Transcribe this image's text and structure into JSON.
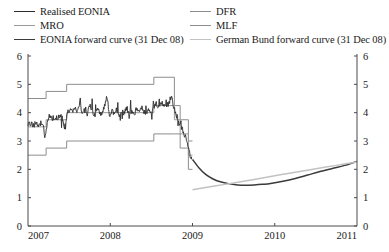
{
  "legend": {
    "left_column": [
      {
        "label": "Realised EONIA",
        "color": "#2b2b2b",
        "key": "realised-eonia"
      },
      {
        "label": "MRO",
        "color": "#9a9a9a",
        "key": "mro"
      },
      {
        "label": "EONIA forward curve (31 Dec 08)",
        "color": "#3a3a3a",
        "key": "eonia-forward-curve"
      }
    ],
    "right_column": [
      {
        "label": "DFR",
        "color": "#8d8d8d",
        "key": "dfr"
      },
      {
        "label": "MLF",
        "color": "#8d8d8d",
        "key": "mlf"
      },
      {
        "label": "German Bund forward curve (31 Dec 08)",
        "color": "#c2c2c2",
        "key": "german-bund-forward-curve"
      }
    ]
  },
  "axes": {
    "y_left_ticks": [
      "0",
      "1",
      "2",
      "3",
      "4",
      "5",
      "6"
    ],
    "y_right_ticks": [
      "0",
      "1",
      "2",
      "3",
      "4",
      "5",
      "6"
    ],
    "x_ticks": [
      "2007",
      "2008",
      "2009",
      "2010",
      "2011"
    ]
  },
  "chart_data": {
    "type": "line",
    "title": "",
    "subtitle": "",
    "xlabel": "",
    "ylabel": "",
    "xlim": [
      2007.0,
      2011.0
    ],
    "ylim": [
      0,
      6
    ],
    "grid": false,
    "legend_position": "top",
    "x_tick_values": [
      2007,
      2008,
      2009,
      2010,
      2011
    ],
    "y_tick_values": [
      0,
      1,
      2,
      3,
      4,
      5,
      6
    ],
    "series": [
      {
        "name": "MLF",
        "color": "#8d8d8d",
        "style": "step",
        "points": [
          [
            2007.0,
            4.5
          ],
          [
            2007.22,
            4.5
          ],
          [
            2007.22,
            4.75
          ],
          [
            2007.47,
            4.75
          ],
          [
            2007.47,
            5.0
          ],
          [
            2008.53,
            5.0
          ],
          [
            2008.53,
            5.25
          ],
          [
            2008.78,
            5.25
          ],
          [
            2008.78,
            4.25
          ],
          [
            2008.85,
            4.25
          ],
          [
            2008.85,
            3.75
          ],
          [
            2008.95,
            3.75
          ],
          [
            2008.95,
            3.0
          ],
          [
            2009.0,
            3.0
          ]
        ]
      },
      {
        "name": "MRO",
        "color": "#9a9a9a",
        "style": "step",
        "points": [
          [
            2007.0,
            3.5
          ],
          [
            2007.22,
            3.5
          ],
          [
            2007.22,
            3.75
          ],
          [
            2007.47,
            3.75
          ],
          [
            2007.47,
            4.0
          ],
          [
            2008.53,
            4.0
          ],
          [
            2008.53,
            4.25
          ],
          [
            2008.78,
            4.25
          ],
          [
            2008.78,
            3.75
          ],
          [
            2008.85,
            3.75
          ],
          [
            2008.85,
            3.25
          ],
          [
            2008.95,
            3.25
          ],
          [
            2008.95,
            2.5
          ],
          [
            2009.0,
            2.5
          ]
        ]
      },
      {
        "name": "DFR",
        "color": "#8d8d8d",
        "style": "step",
        "points": [
          [
            2007.0,
            2.5
          ],
          [
            2007.22,
            2.5
          ],
          [
            2007.22,
            2.75
          ],
          [
            2007.47,
            2.75
          ],
          [
            2007.47,
            3.0
          ],
          [
            2008.53,
            3.0
          ],
          [
            2008.53,
            3.25
          ],
          [
            2008.78,
            3.25
          ],
          [
            2008.78,
            3.25
          ],
          [
            2008.85,
            3.25
          ],
          [
            2008.85,
            2.75
          ],
          [
            2008.95,
            2.75
          ],
          [
            2008.95,
            2.0
          ],
          [
            2009.0,
            2.0
          ]
        ]
      },
      {
        "name": "Realised EONIA",
        "color": "#2b2b2b",
        "style": "noisy-line",
        "points": [
          [
            2007.0,
            3.57
          ],
          [
            2007.03,
            3.62
          ],
          [
            2007.06,
            3.55
          ],
          [
            2007.09,
            3.6
          ],
          [
            2007.12,
            3.58
          ],
          [
            2007.15,
            3.63
          ],
          [
            2007.18,
            3.56
          ],
          [
            2007.21,
            3.1
          ],
          [
            2007.24,
            3.82
          ],
          [
            2007.27,
            3.88
          ],
          [
            2007.3,
            3.8
          ],
          [
            2007.33,
            3.86
          ],
          [
            2007.36,
            3.83
          ],
          [
            2007.39,
            3.9
          ],
          [
            2007.42,
            3.78
          ],
          [
            2007.45,
            3.3
          ],
          [
            2007.48,
            4.05
          ],
          [
            2007.51,
            4.12
          ],
          [
            2007.54,
            4.02
          ],
          [
            2007.57,
            4.2
          ],
          [
            2007.6,
            4.05
          ],
          [
            2007.63,
            4.35
          ],
          [
            2007.66,
            4.0
          ],
          [
            2007.69,
            4.08
          ],
          [
            2007.72,
            3.95
          ],
          [
            2007.75,
            4.3
          ],
          [
            2007.78,
            4.05
          ],
          [
            2007.81,
            3.9
          ],
          [
            2007.84,
            4.15
          ],
          [
            2007.87,
            4.02
          ],
          [
            2007.9,
            3.92
          ],
          [
            2007.93,
            4.25
          ],
          [
            2007.96,
            4.6
          ],
          [
            2007.99,
            3.9
          ],
          [
            2008.02,
            4.05
          ],
          [
            2008.05,
            3.98
          ],
          [
            2008.08,
            4.1
          ],
          [
            2008.11,
            3.95
          ],
          [
            2008.14,
            4.06
          ],
          [
            2008.17,
            4.0
          ],
          [
            2008.2,
            4.18
          ],
          [
            2008.23,
            3.97
          ],
          [
            2008.26,
            4.08
          ],
          [
            2008.29,
            3.96
          ],
          [
            2008.32,
            4.12
          ],
          [
            2008.35,
            4.0
          ],
          [
            2008.38,
            4.22
          ],
          [
            2008.41,
            3.98
          ],
          [
            2008.44,
            4.05
          ],
          [
            2008.47,
            4.1
          ],
          [
            2008.5,
            3.99
          ],
          [
            2008.53,
            4.2
          ],
          [
            2008.56,
            4.3
          ],
          [
            2008.59,
            4.22
          ],
          [
            2008.62,
            4.35
          ],
          [
            2008.65,
            4.25
          ],
          [
            2008.68,
            4.4
          ],
          [
            2008.71,
            4.28
          ],
          [
            2008.74,
            4.6
          ],
          [
            2008.77,
            4.2
          ],
          [
            2008.8,
            3.95
          ],
          [
            2008.83,
            3.7
          ],
          [
            2008.86,
            3.55
          ],
          [
            2008.89,
            3.3
          ],
          [
            2008.92,
            3.1
          ],
          [
            2008.95,
            2.7
          ],
          [
            2008.97,
            2.5
          ],
          [
            2008.99,
            2.35
          ]
        ]
      },
      {
        "name": "EONIA forward curve (31 Dec 08)",
        "color": "#3a3a3a",
        "style": "smooth",
        "points": [
          [
            2009.0,
            2.35
          ],
          [
            2009.08,
            2.05
          ],
          [
            2009.16,
            1.82
          ],
          [
            2009.25,
            1.66
          ],
          [
            2009.35,
            1.55
          ],
          [
            2009.45,
            1.49
          ],
          [
            2009.55,
            1.45
          ],
          [
            2009.65,
            1.44
          ],
          [
            2009.75,
            1.45
          ],
          [
            2009.85,
            1.47
          ],
          [
            2009.95,
            1.5
          ],
          [
            2010.1,
            1.58
          ],
          [
            2010.25,
            1.68
          ],
          [
            2010.4,
            1.8
          ],
          [
            2010.55,
            1.92
          ],
          [
            2010.7,
            2.03
          ],
          [
            2010.85,
            2.14
          ],
          [
            2011.0,
            2.28
          ]
        ]
      },
      {
        "name": "German Bund forward curve (31 Dec 08)",
        "color": "#c2c2c2",
        "style": "smooth",
        "points": [
          [
            2009.0,
            1.28
          ],
          [
            2009.25,
            1.4
          ],
          [
            2009.5,
            1.52
          ],
          [
            2009.75,
            1.64
          ],
          [
            2010.0,
            1.77
          ],
          [
            2010.25,
            1.9
          ],
          [
            2010.5,
            2.02
          ],
          [
            2010.75,
            2.14
          ],
          [
            2011.0,
            2.26
          ]
        ]
      }
    ]
  }
}
